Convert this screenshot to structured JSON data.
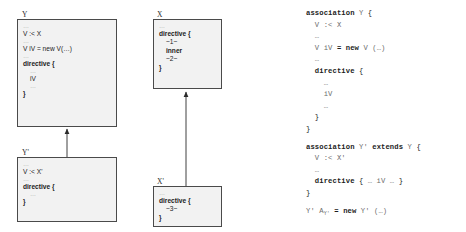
{
  "diagram": {
    "boxes": [
      {
        "id": "Y",
        "label": "Y",
        "lines": [
          {
            "text": "…",
            "style": "dots"
          },
          {
            "text": "V :< X",
            "style": "plain"
          },
          {
            "text": "…",
            "style": "dots"
          },
          {
            "text": "V iV = new V(…)",
            "style": "mixed-new"
          },
          {
            "text": "…",
            "style": "dots"
          },
          {
            "text": "directive {",
            "style": "bold"
          },
          {
            "text": "…",
            "style": "dots-indent"
          },
          {
            "text": "iV",
            "style": "indent"
          },
          {
            "text": "…",
            "style": "dots-indent"
          },
          {
            "text": "}",
            "style": "bold"
          }
        ]
      },
      {
        "id": "X",
        "label": "X",
        "lines": [
          {
            "text": "…",
            "style": "dots"
          },
          {
            "text": "directive {",
            "style": "bold"
          },
          {
            "text": "~1~",
            "style": "indent"
          },
          {
            "text": "inner",
            "style": "bold-indent"
          },
          {
            "text": "~2~",
            "style": "indent"
          },
          {
            "text": "}",
            "style": "bold"
          }
        ]
      },
      {
        "id": "Yprime",
        "label": "Y'",
        "lines": [
          {
            "text": "…",
            "style": "dots"
          },
          {
            "text": "V :< X'",
            "style": "plain"
          },
          {
            "text": "…",
            "style": "dots"
          },
          {
            "text": "directive {",
            "style": "bold"
          },
          {
            "text": "…",
            "style": "dots-indent"
          },
          {
            "text": "}",
            "style": "bold"
          }
        ]
      },
      {
        "id": "Xprime",
        "label": "X'",
        "lines": [
          {
            "text": "…",
            "style": "dots"
          },
          {
            "text": "directive {",
            "style": "bold"
          },
          {
            "text": "~3~",
            "style": "indent"
          },
          {
            "text": "}",
            "style": "bold"
          }
        ]
      }
    ],
    "arrows": [
      {
        "from": "Yprime",
        "to": "Y",
        "kind": "extends-arrow"
      },
      {
        "from": "Xprime",
        "to": "X",
        "kind": "extends-arrow"
      }
    ]
  },
  "listing": {
    "lines": [
      {
        "id": "l1",
        "html": "<span class=\"kw\">association</span> <span class=\"dim\">Y</span> {"
      },
      {
        "id": "l2",
        "html": "  <span class=\"dim\">V :&lt; X</span>"
      },
      {
        "id": "l3",
        "html": "  <span class=\"dim\">…</span>"
      },
      {
        "id": "l4",
        "html": "  <span class=\"dim\">V iV</span> <span class=\"kw\">=</span> <span class=\"kw\">new</span> <span class=\"dim\">V (…)</span>"
      },
      {
        "id": "l5",
        "html": "  <span class=\"dim\">…</span>"
      },
      {
        "id": "l6",
        "html": "  <span class=\"kw\">directive</span> {"
      },
      {
        "id": "l7",
        "html": "    <span class=\"dim\">…</span>"
      },
      {
        "id": "l8",
        "html": "    <span class=\"dim\">iV</span>"
      },
      {
        "id": "l9",
        "html": "    <span class=\"dim\">…</span>"
      },
      {
        "id": "l10",
        "html": "  }"
      },
      {
        "id": "l11",
        "html": "}"
      },
      {
        "id": "gap1",
        "html": "",
        "gap": true
      },
      {
        "id": "l12",
        "html": "<span class=\"kw\">association</span> <span class=\"dim\">Y'</span> <span class=\"kw\">extends</span> <span class=\"dim\">Y</span> {"
      },
      {
        "id": "l13",
        "html": "  <span class=\"dim\">V :&lt; X'</span>"
      },
      {
        "id": "l14",
        "html": "  <span class=\"dim\">…</span>"
      },
      {
        "id": "l15",
        "html": "  <span class=\"kw\">directive</span> { <span class=\"dim\">… iV …</span> }"
      },
      {
        "id": "l16",
        "html": "}"
      },
      {
        "id": "gap2",
        "html": "",
        "gap": true
      },
      {
        "id": "l17",
        "html": "<span class=\"dim\">Y' A<span class=\"sub\">Y'</span></span> <span class=\"kw\">=</span> <span class=\"kw\">new</span> <span class=\"dim\">Y' (…)</span>"
      }
    ]
  },
  "colors": {
    "box_fill": "#f2f2f2",
    "box_border": "#4a4a4a",
    "text": "#1c1c1c",
    "dim_text": "#6e6e6e",
    "arrow": "#2a2a2a",
    "background": "#ffffff"
  }
}
